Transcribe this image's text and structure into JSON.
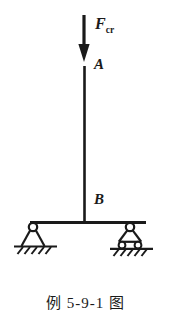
{
  "figure": {
    "caption": "例 5-9-1 图",
    "background_color": "#ffffff",
    "ink_color": "#1a1a1a",
    "labels": {
      "force_symbol": "F",
      "force_subscript": "cr",
      "point_top": "A",
      "point_bottom": "B"
    },
    "elements": {
      "load_arrow_name": "critical-load-arrow",
      "column_name": "vertical-column",
      "beam_name": "horizontal-beam",
      "left_support_type": "pin-support",
      "right_support_type": "roller-support",
      "ground_hatching": "diagonal-hatch"
    }
  }
}
